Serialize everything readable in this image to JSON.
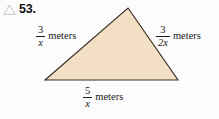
{
  "problem": {
    "icon": "triangle-outline-icon",
    "number": "53."
  },
  "figure": {
    "shape": "triangle",
    "fill_color": "#f2dfc4",
    "stroke_color": "#3b2f26",
    "vertices": {
      "apex": [
        128,
        8
      ],
      "bottom_left": [
        45,
        80
      ],
      "bottom_right": [
        178,
        80
      ]
    }
  },
  "labels": {
    "left_side": {
      "numerator": "3",
      "denominator": "x",
      "unit": "meters"
    },
    "right_side": {
      "numerator": "3",
      "denominator": "2x",
      "unit": "meters"
    },
    "bottom_side": {
      "numerator": "5",
      "denominator": "x",
      "unit": "meters"
    }
  }
}
